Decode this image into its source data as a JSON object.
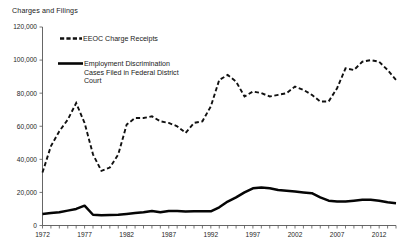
{
  "chart_data": {
    "type": "line",
    "title": "Charges and Filings",
    "xlabel": "",
    "ylabel": "",
    "ylim": [
      0,
      120000
    ],
    "xlim": [
      1972,
      2014
    ],
    "grid": false,
    "legend_position": "top-center-inside",
    "y_ticks": [
      "0",
      "20,000",
      "40,000",
      "60,000",
      "80,000",
      "100,000",
      "120,000"
    ],
    "y_tick_values": [
      0,
      20000,
      40000,
      60000,
      80000,
      100000,
      120000
    ],
    "x_tick_labels": [
      "1972",
      "1977",
      "1982",
      "1987",
      "1992",
      "1997",
      "2002",
      "2007",
      "2012"
    ],
    "x_tick_values": [
      1972,
      1977,
      1982,
      1987,
      1992,
      1997,
      2002,
      2007,
      2012
    ],
    "x": [
      1972,
      1973,
      1974,
      1975,
      1976,
      1977,
      1978,
      1979,
      1980,
      1981,
      1982,
      1983,
      1984,
      1985,
      1986,
      1987,
      1988,
      1989,
      1990,
      1991,
      1992,
      1993,
      1994,
      1995,
      1996,
      1997,
      1998,
      1999,
      2000,
      2001,
      2002,
      2003,
      2004,
      2005,
      2006,
      2007,
      2008,
      2009,
      2010,
      2011,
      2012,
      2013,
      2014
    ],
    "series": [
      {
        "name": "EEOC Charge Receipts",
        "style": "dashed",
        "color": "#111111",
        "values": [
          32000,
          48000,
          57000,
          64000,
          74000,
          62000,
          43000,
          33000,
          35000,
          43000,
          61000,
          65000,
          65000,
          66000,
          63000,
          62000,
          60000,
          56000,
          62000,
          63000,
          72000,
          88000,
          91000,
          87000,
          78000,
          81000,
          80000,
          78000,
          79000,
          80000,
          84000,
          82000,
          79000,
          75000,
          75000,
          83000,
          95000,
          94000,
          99000,
          100000,
          99000,
          94000,
          88000
        ]
      },
      {
        "name": "Employment Discrimination Cases Filed in Federal District Court",
        "style": "solid",
        "color": "#050505",
        "values": [
          7000,
          7500,
          8000,
          9000,
          10000,
          12000,
          6500,
          6200,
          6300,
          6500,
          7000,
          7500,
          8000,
          8800,
          8000,
          8800,
          8800,
          8500,
          8600,
          8600,
          8600,
          11000,
          14500,
          17000,
          20000,
          22500,
          23000,
          22500,
          21500,
          21000,
          20500,
          20000,
          19500,
          17000,
          15000,
          14500,
          14500,
          15000,
          15500,
          15500,
          15000,
          14000,
          13500
        ]
      }
    ]
  },
  "legend": {
    "items": [
      {
        "label": "EEOC Charge Receipts",
        "style": "dashed"
      },
      {
        "label": "Employment Discrimination",
        "label_line2": "Cases Filed in Federal District",
        "label_line3": "Court",
        "style": "solid"
      }
    ]
  }
}
